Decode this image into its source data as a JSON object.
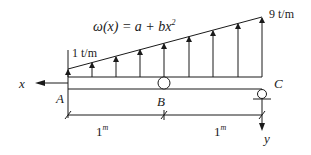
{
  "diagram": {
    "load_equation": {
      "lhs": "ω(x) = a + bx",
      "exponent": "2"
    },
    "load_left": "1 t/m",
    "load_right": "9 t/m",
    "axis_x_label": "x",
    "axis_y_label": "y",
    "points": {
      "A": "A",
      "B": "B",
      "C": "C"
    },
    "spans": [
      {
        "value": "1",
        "unit": "m"
      },
      {
        "value": "1",
        "unit": "m"
      }
    ],
    "colors": {
      "stroke": "#1a1a1a",
      "background": "#ffffff"
    }
  }
}
